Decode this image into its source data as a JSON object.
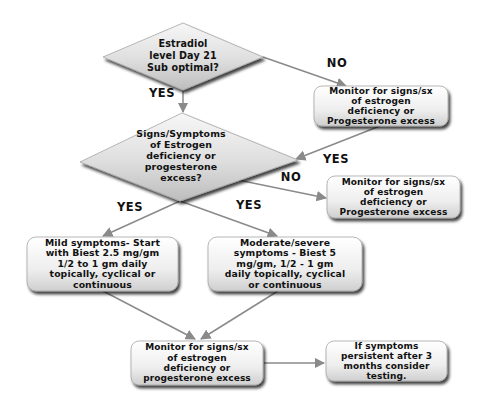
{
  "diagram": {
    "type": "flowchart",
    "colors": {
      "background": "#ffffff",
      "shape_fill_light": "#f4f4f4",
      "shape_fill_dark": "#c8c8c8",
      "shape_stroke": "#9a9a9a",
      "connector": "#8a8a8a",
      "text": "#111111"
    },
    "nodes": {
      "decision_estradiol": {
        "shape": "diamond",
        "text": "Estradiol\nlevel Day 21\nSub optimal?"
      },
      "decision_signs": {
        "shape": "diamond",
        "text": "Signs/Symptoms\nof Estrogen\ndeficiency or\nprogesterone\nexcess?"
      },
      "monitor_top": {
        "shape": "rounded-rect",
        "text": "Monitor for signs/sx\nof estrogen\ndeficiency or\nProgesterone excess"
      },
      "monitor_right": {
        "shape": "rounded-rect",
        "text": "Monitor for signs/sx\nof estrogen\ndeficiency or\nProgesterone excess"
      },
      "mild_symptoms": {
        "shape": "rounded-rect",
        "text": "Mild symptoms- Start\nwith Biest 2.5 mg/gm\n1/2 to 1 gm daily\ntopically, cyclical or\ncontinuous"
      },
      "moderate_symptoms": {
        "shape": "rounded-rect",
        "text": "Moderate/severe\nsymptoms - Biest 5\nmg/gm, 1/2 - 1 gm\ndaily topically, cyclical\nor continuous"
      },
      "monitor_bottom": {
        "shape": "rounded-rect",
        "text": "Monitor for signs/sx\nof estrogen\ndeficiency or\nprogesterone excess"
      },
      "persistent": {
        "shape": "rounded-rect",
        "text": "If symptoms\npersistent after 3\nmonths consider\ntesting."
      }
    },
    "edge_labels": {
      "estradiol_no": "NO",
      "estradiol_yes": "YES",
      "monitor_top_yes": "YES",
      "signs_no": "NO",
      "signs_yes_left": "YES",
      "signs_yes_right": "YES"
    },
    "edges": [
      {
        "from": "decision_estradiol",
        "to": "monitor_top",
        "label": "NO"
      },
      {
        "from": "decision_estradiol",
        "to": "decision_signs",
        "label": "YES"
      },
      {
        "from": "monitor_top",
        "to": "decision_signs",
        "label": "YES"
      },
      {
        "from": "decision_signs",
        "to": "monitor_right",
        "label": "NO"
      },
      {
        "from": "decision_signs",
        "to": "mild_symptoms",
        "label": "YES"
      },
      {
        "from": "decision_signs",
        "to": "moderate_symptoms",
        "label": "YES"
      },
      {
        "from": "mild_symptoms",
        "to": "monitor_bottom",
        "label": ""
      },
      {
        "from": "moderate_symptoms",
        "to": "monitor_bottom",
        "label": ""
      },
      {
        "from": "monitor_bottom",
        "to": "persistent",
        "label": ""
      }
    ]
  }
}
